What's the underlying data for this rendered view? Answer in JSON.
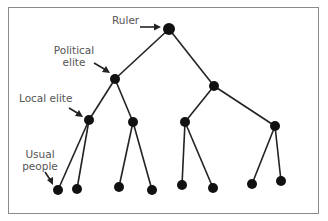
{
  "diagram": {
    "type": "hierarchy-tree",
    "colors": {
      "node": "#111111",
      "edge": "#222222",
      "label": "#555555",
      "frame": "#8a8a8a"
    },
    "labels": {
      "ruler": "Ruler",
      "political_elite_line1": "Political",
      "political_elite_line2": "elite",
      "local_elite": "Local elite",
      "usual_people_line1": "Usual",
      "usual_people_line2": "people"
    },
    "levels": [
      {
        "name": "Ruler",
        "nodes": 1
      },
      {
        "name": "Political elite",
        "nodes": 2
      },
      {
        "name": "Local elite",
        "nodes": 4
      },
      {
        "name": "Usual people",
        "nodes": 8
      }
    ]
  }
}
